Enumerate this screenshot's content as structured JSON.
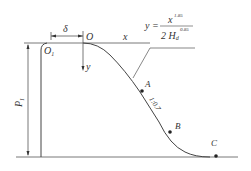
{
  "diagram": {
    "type": "weir-profile",
    "labels": {
      "delta": "δ",
      "origin": "O",
      "origin1": "O",
      "origin1_sub": "1",
      "x_axis": "x",
      "y_axis": "y",
      "height": "P",
      "height_sub": "1",
      "point_a": "A",
      "point_b": "B",
      "point_c": "C",
      "slope": "1:0.7"
    },
    "equation": {
      "lhs": "y =",
      "numerator": "x",
      "numerator_exp": "1.85",
      "denominator": "2 H",
      "denominator_sub": "d",
      "denominator_exp": "0.85"
    },
    "colors": {
      "line": "#444444",
      "text": "#333333"
    }
  }
}
